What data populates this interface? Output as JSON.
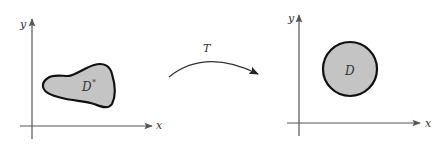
{
  "diagram": {
    "type": "transformation-mapping",
    "left_panel": {
      "x_axis_label": "x",
      "y_axis_label": "y",
      "region_label": "D",
      "region_superscript": "*",
      "region_shape": "irregular-blob"
    },
    "transformation": {
      "label": "T",
      "direction": "left-to-right"
    },
    "right_panel": {
      "x_axis_label": "x",
      "y_axis_label": "y",
      "region_label": "D",
      "region_shape": "disk"
    },
    "colors": {
      "region_fill": "#c4c4c4",
      "region_stroke": "#111111",
      "axis": "#555555",
      "arrow": "#333333",
      "background": "#ffffff"
    }
  }
}
